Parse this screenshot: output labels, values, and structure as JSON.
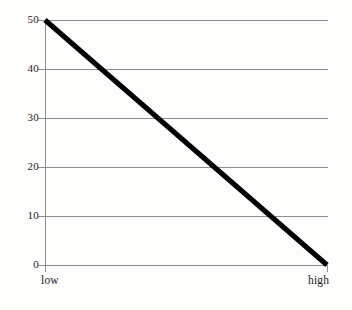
{
  "chart_data": {
    "type": "line",
    "title": "",
    "subtitle": "",
    "xlabel": "",
    "ylabel": "",
    "x": [
      "low",
      "high"
    ],
    "categories": [
      "low",
      "high"
    ],
    "series": [
      {
        "name": "",
        "values": [
          50,
          0
        ]
      }
    ],
    "xtick_labels": [
      "low",
      "high"
    ],
    "ytick_labels": [
      "50",
      "40",
      "30",
      "20",
      "10",
      "0"
    ],
    "ytick_values": [
      50,
      40,
      30,
      20,
      10,
      0
    ],
    "ylim": [
      0,
      50
    ],
    "grid": "horizontal",
    "legend": "none",
    "annotations": [],
    "colors": {
      "line": "#000000",
      "grid": "#8e8e8e",
      "axis": "#8e8e8e",
      "text": "#1b1b1b",
      "background": "#fdfdfc"
    }
  },
  "axis": {
    "y_ticks": [
      {
        "label": "50",
        "value": 50
      },
      {
        "label": "40",
        "value": 40
      },
      {
        "label": "30",
        "value": 30
      },
      {
        "label": "20",
        "value": 20
      },
      {
        "label": "10",
        "value": 10
      },
      {
        "label": "0",
        "value": 0
      }
    ],
    "x_ticks": [
      {
        "label": "low"
      },
      {
        "label": "high"
      }
    ]
  }
}
